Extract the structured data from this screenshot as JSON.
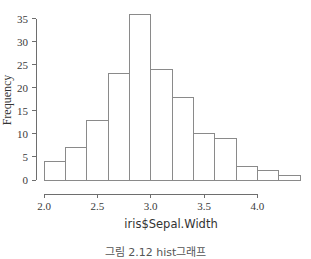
{
  "caption": "그림 2.12 hist그래프",
  "chart_data": {
    "type": "bar",
    "title": "",
    "subtitle": "",
    "xlabel": "iris$Sepal.Width",
    "ylabel": "Frequency",
    "xlim": [
      2.0,
      4.4
    ],
    "ylim": [
      0,
      36
    ],
    "grid": false,
    "legend": null,
    "bin_width": 0.2,
    "bin_edges": [
      2.0,
      2.2,
      2.4,
      2.6,
      2.8,
      3.0,
      3.2,
      3.4,
      3.6,
      3.8,
      4.0,
      4.2,
      4.4
    ],
    "categories": [
      "2.0-2.2",
      "2.2-2.4",
      "2.4-2.6",
      "2.6-2.8",
      "2.8-3.0",
      "3.0-3.2",
      "3.2-3.4",
      "3.4-3.6",
      "3.6-3.8",
      "3.8-4.0",
      "4.0-4.2",
      "4.2-4.4"
    ],
    "values": [
      4,
      7,
      13,
      23,
      36,
      24,
      18,
      10,
      9,
      3,
      2,
      1
    ],
    "x_ticks": [
      2.0,
      2.5,
      3.0,
      3.5,
      4.0
    ],
    "x_tick_labels": [
      "2.0",
      "2.5",
      "3.0",
      "3.5",
      "4.0"
    ],
    "y_ticks": [
      0,
      5,
      10,
      15,
      20,
      25,
      30,
      35
    ],
    "y_tick_labels": [
      "0",
      "5",
      "10",
      "15",
      "20",
      "25",
      "30",
      "35"
    ],
    "bar_fill": "#ffffff",
    "bar_stroke": "#8a8a8a",
    "axis_color": "#6e6e6e"
  }
}
